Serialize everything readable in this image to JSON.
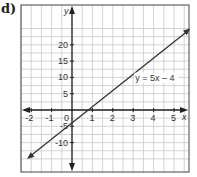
{
  "label": "d)",
  "chart_data": {
    "type": "line",
    "title": "",
    "xlabel": "x",
    "ylabel": "y",
    "xlim": [
      -2.5,
      5.8
    ],
    "ylim": [
      -15,
      25
    ],
    "x_ticks": [
      -2,
      -1,
      0,
      1,
      2,
      3,
      4,
      5
    ],
    "x_tick_labels": [
      "-2",
      "-1",
      "0",
      "1",
      "2",
      "3",
      "4",
      "5"
    ],
    "y_ticks": [
      -10,
      -5,
      5,
      10,
      15,
      20
    ],
    "y_tick_labels": [
      "-10",
      "-5",
      "5",
      "10",
      "15",
      "20"
    ],
    "grid": true,
    "series": [
      {
        "name": "y = 5x - 4",
        "equation": "y = 5x - 4",
        "x": [
          -2.2,
          5.8
        ],
        "y": [
          -15,
          25
        ]
      }
    ],
    "annotations": [
      {
        "text": "y = 5x – 4",
        "x": 3.1,
        "y": 9
      }
    ]
  }
}
